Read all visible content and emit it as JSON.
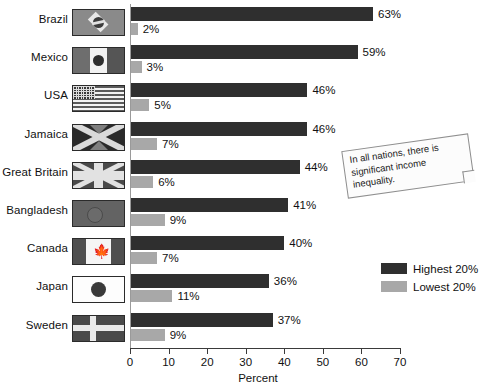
{
  "chart_data": {
    "type": "bar",
    "orientation": "horizontal",
    "title": "",
    "xlabel": "Percent",
    "ylabel": "",
    "xlim": [
      0,
      70
    ],
    "xticks": [
      0,
      10,
      20,
      30,
      40,
      50,
      60,
      70
    ],
    "grid": false,
    "legend_position": "right",
    "categories": [
      "Brazil",
      "Mexico",
      "USA",
      "Jamaica",
      "Great Britain",
      "Bangladesh",
      "Canada",
      "Japan",
      "Sweden"
    ],
    "series": [
      {
        "name": "Highest 20%",
        "color": "#2f2f2f",
        "values": [
          63,
          59,
          46,
          46,
          44,
          41,
          40,
          36,
          37
        ],
        "labels": [
          "63%",
          "59%",
          "46%",
          "46%",
          "44%",
          "41%",
          "40%",
          "36%",
          "37%"
        ]
      },
      {
        "name": "Lowest 20%",
        "color": "#a8a8a8",
        "values": [
          2,
          3,
          5,
          7,
          6,
          9,
          7,
          11,
          9
        ],
        "labels": [
          "2%",
          "3%",
          "5%",
          "7%",
          "6%",
          "9%",
          "7%",
          "11%",
          "9%"
        ]
      }
    ],
    "annotations": [
      "In all nations, there is significant income inequality."
    ],
    "flags": [
      "brazil",
      "mexico",
      "usa",
      "jamaica",
      "great-britain",
      "bangladesh",
      "canada",
      "japan",
      "sweden"
    ]
  },
  "legend": {
    "items": [
      {
        "label": "Highest 20%",
        "color": "#2f2f2f"
      },
      {
        "label": "Lowest 20%",
        "color": "#a8a8a8"
      }
    ]
  },
  "axis": {
    "title": "Percent",
    "ticks": [
      "0",
      "10",
      "20",
      "30",
      "40",
      "50",
      "60",
      "70"
    ]
  },
  "annotation": {
    "text": "In all nations, there is significant income inequality."
  }
}
